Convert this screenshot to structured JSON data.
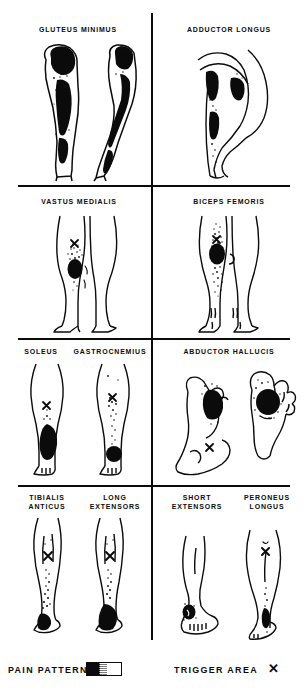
{
  "figure": {
    "ink_color": "#0b0b0b",
    "background_color": "#ffffff"
  },
  "panels": [
    {
      "id": "panel-gluteus-minimus",
      "label": "GLUTEUS MINIMUS",
      "row": 1,
      "column": "left",
      "views": [
        "posterior leg",
        "lateral leg"
      ],
      "trigger_marks": 1,
      "pain_pattern": "buttock down posterolateral thigh and calf"
    },
    {
      "id": "panel-adductor-longus",
      "label": "ADDUCTOR LONGUS",
      "row": 1,
      "column": "right",
      "views": [
        "medial thigh, flexed hip"
      ],
      "trigger_marks": 0,
      "pain_pattern": "groin and anteromedial thigh to medial knee and shin"
    },
    {
      "id": "panel-vastus-medialis",
      "label": "VASTUS MEDIALIS",
      "row": 2,
      "column": "left",
      "views": [
        "anterior both legs"
      ],
      "trigger_marks": 1,
      "pain_pattern": "medial distal thigh and knee"
    },
    {
      "id": "panel-biceps-femoris",
      "label": "BICEPS FEMORIS",
      "row": 2,
      "column": "right",
      "views": [
        "posterior both legs"
      ],
      "trigger_marks": 1,
      "pain_pattern": "posterior knee and distal thigh"
    },
    {
      "id": "panel-soleus",
      "label": "SOLEUS",
      "row": 3,
      "column": "left",
      "views": [
        "posterior calf"
      ],
      "trigger_marks": 1,
      "pain_pattern": "lower calf to heel"
    },
    {
      "id": "panel-gastrocnemius",
      "label": "GASTROCNEMIUS",
      "row": 3,
      "column": "left",
      "views": [
        "posterior calf"
      ],
      "trigger_marks": 1,
      "pain_pattern": "calf down to ankle"
    },
    {
      "id": "panel-abductor-hallucis",
      "label": "ABDUCTOR HALLUCIS",
      "row": 3,
      "column": "right",
      "views": [
        "medial foot",
        "plantar foot"
      ],
      "trigger_marks": 1,
      "pain_pattern": "medial heel and great toe border"
    },
    {
      "id": "panel-tibialis-anticus",
      "label": "TIBIALIS\nANTICUS",
      "row": 4,
      "column": "left",
      "views": [
        "anterior lower leg"
      ],
      "trigger_marks": 1,
      "pain_pattern": "anterior shin to great toe"
    },
    {
      "id": "panel-long-extensors",
      "label": "LONG\nEXTENSORS",
      "row": 4,
      "column": "left",
      "views": [
        "anterior lower leg"
      ],
      "trigger_marks": 1,
      "pain_pattern": "anterior shin to dorsum of foot"
    },
    {
      "id": "panel-short-extensors",
      "label": "SHORT\nEXTENSORS",
      "row": 4,
      "column": "right",
      "views": [
        "dorsum of foot"
      ],
      "trigger_marks": 0,
      "pain_pattern": "dorsum of midfoot"
    },
    {
      "id": "panel-peroneus-longus",
      "label": "PERONEUS\nLONGUS",
      "row": 4,
      "column": "right",
      "views": [
        "lateral lower leg"
      ],
      "trigger_marks": 1,
      "pain_pattern": "lateral leg above and behind lateral malleolus"
    }
  ],
  "legend": {
    "pain_pattern_label": "PAIN PATTERN",
    "trigger_area_label": "TRIGGER AREA",
    "trigger_symbol": "✕",
    "swatch_description": "solid-to-stippled gradient bar"
  }
}
